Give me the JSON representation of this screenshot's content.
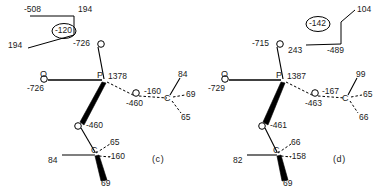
{
  "figure": {
    "type": "molecular-conformation-diagram",
    "background_color": "#ffffff",
    "line_color": "#000000"
  },
  "panels": [
    {
      "id": "c",
      "label": "(c)",
      "inset": {
        "name": "bond-angle-inset",
        "values": [
          "-508",
          "194",
          "194"
        ],
        "circled_value": "-120"
      },
      "atoms": [
        {
          "symbol": "O",
          "name": "phosphoryl-oxygen-top",
          "value": "-726"
        },
        {
          "symbol": "O",
          "name": "phosphoryl-oxygen-left",
          "value": "-726"
        },
        {
          "symbol": "P",
          "name": "phosphorus-center",
          "value": "1378"
        },
        {
          "symbol": "O",
          "name": "ester-oxygen-right",
          "value": "-460"
        },
        {
          "symbol": "O",
          "name": "ester-oxygen-lower",
          "value": "-460"
        },
        {
          "symbol": "C",
          "name": "carbon-right",
          "value": "-160"
        },
        {
          "symbol": "C",
          "name": "carbon-lower",
          "value": "-160"
        }
      ],
      "hydrogens_right_carbon": [
        "84",
        "69",
        "65"
      ],
      "hydrogens_lower_carbon": [
        "84",
        "65",
        "69"
      ]
    },
    {
      "id": "d",
      "label": "(d)",
      "inset": {
        "name": "bond-angle-inset",
        "values": [
          "104",
          "243",
          "-489"
        ],
        "circled_value": "-142"
      },
      "atoms": [
        {
          "symbol": "O",
          "name": "phosphoryl-oxygen-top",
          "value": "-715"
        },
        {
          "symbol": "O",
          "name": "phosphoryl-oxygen-left",
          "value": "-729"
        },
        {
          "symbol": "P",
          "name": "phosphorus-center",
          "value": "1387"
        },
        {
          "symbol": "O",
          "name": "ester-oxygen-right",
          "value": "-463"
        },
        {
          "symbol": "O",
          "name": "ester-oxygen-lower",
          "value": "-461"
        },
        {
          "symbol": "C",
          "name": "carbon-right",
          "value": "-167"
        },
        {
          "symbol": "C",
          "name": "carbon-lower",
          "value": "-158"
        }
      ],
      "hydrogens_right_carbon": [
        "99",
        "65",
        "66"
      ],
      "hydrogens_lower_carbon": [
        "82",
        "66",
        "69"
      ]
    }
  ],
  "labels": {
    "c": {
      "inset_left_top": "-508",
      "inset_right_top": "194",
      "inset_left_bottom": "194",
      "inset_circle": "-120",
      "o_top": "-726",
      "o_left": "-726",
      "p_center": "1378",
      "p_symbol": "P",
      "o_symbol_top": "O",
      "o_symbol_left": "O",
      "o_mid_right": "-460",
      "o_symbol_mid": "O",
      "o_lower": "-460",
      "o_symbol_lower": "O",
      "c_right": "-160",
      "c_symbol_right": "C",
      "c_right_h1": "84",
      "c_right_h2": "69",
      "c_right_h3": "65",
      "c_lower": "-160",
      "c_symbol_lower": "C",
      "c_lower_h1": "65",
      "c_lower_h2": "84",
      "c_lower_h3": "69",
      "panel_label": "(c)"
    },
    "d": {
      "inset_circle": "-142",
      "inset_right_top": "104",
      "inset_left_bottom": "243",
      "inset_right_bottom": "-489",
      "o_top": "-715",
      "o_left": "-729",
      "p_center": "1387",
      "p_symbol": "P",
      "o_symbol_top": "O",
      "o_symbol_left": "O",
      "o_mid_right": "-463",
      "o_symbol_mid": "O",
      "o_lower": "-461",
      "o_symbol_lower": "O",
      "c_right": "-167",
      "c_symbol_right": "C",
      "c_right_h1": "99",
      "c_right_h2": "65",
      "c_right_h3": "66",
      "c_lower": "-158",
      "c_symbol_lower": "C",
      "c_lower_h1": "66",
      "c_lower_h2": "82",
      "c_lower_h3": "69",
      "panel_label": "(d)"
    }
  }
}
